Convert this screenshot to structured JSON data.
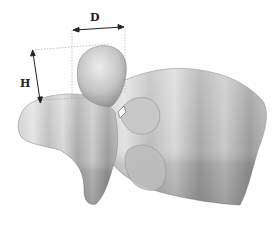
{
  "figure": {
    "annotations": [
      {
        "id": "D",
        "label": "D",
        "meaning": "horizontal width of dome"
      },
      {
        "id": "H",
        "label": "H",
        "meaning": "height of dome"
      }
    ],
    "colors": {
      "background": "#ffffff",
      "bone_light": "#e4e4e4",
      "bone_mid": "#b8b8b8",
      "bone_dark": "#8c8c8c",
      "annotation": "#222222",
      "guide_line": "#9a9a9a"
    }
  }
}
